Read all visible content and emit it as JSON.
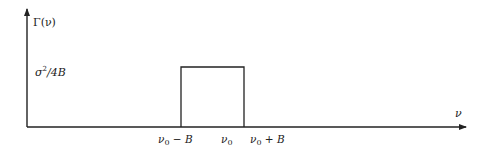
{
  "diagram": {
    "y_axis_label": "Γ(ν)",
    "x_axis_label": "ν",
    "level_label_base": "σ",
    "level_label_exp": "2",
    "level_label_tail": "/4B",
    "ticks": [
      {
        "main": "ν",
        "sub": "0",
        "tail": " − B"
      },
      {
        "main": "ν",
        "sub": "0",
        "tail": ""
      },
      {
        "main": "ν",
        "sub": "0",
        "tail": " + B"
      }
    ],
    "colors": {
      "stroke": "#222222",
      "background": "#ffffff"
    }
  }
}
